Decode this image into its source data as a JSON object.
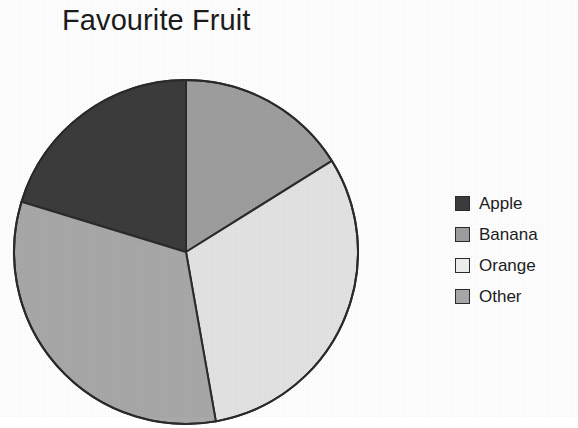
{
  "chart_data": {
    "type": "pie",
    "title": "Favourite Fruit",
    "subtitle": "",
    "xlabel": "",
    "ylabel": "",
    "grid": false,
    "legend_position": "right",
    "categories": [
      "Apple",
      "Banana",
      "Orange",
      "Other"
    ],
    "values": [
      20.5,
      16.0,
      31.0,
      32.5
    ],
    "units": "percent",
    "start_angle_deg": 0,
    "direction": "clockwise",
    "slices": [
      {
        "label": "Apple",
        "value": 20.5,
        "color": "#3c3c3c",
        "start_angle_deg": 287,
        "end_angle_deg": 360
      },
      {
        "label": "Banana",
        "value": 16.0,
        "color": "#9e9e9e",
        "start_angle_deg": 0,
        "end_angle_deg": 58
      },
      {
        "label": "Orange",
        "value": 31.0,
        "color": "#e3e3e3",
        "start_angle_deg": 58,
        "end_angle_deg": 170
      },
      {
        "label": "Other",
        "value": 32.5,
        "color": "#a8a8a8",
        "start_angle_deg": 170,
        "end_angle_deg": 287
      }
    ],
    "geometry": {
      "center_x": 176,
      "center_y": 176,
      "radius": 172,
      "outline_color": "#2b2b2b"
    }
  },
  "legend": {
    "items": [
      {
        "label": "Apple",
        "color": "#3c3c3c"
      },
      {
        "label": "Banana",
        "color": "#9e9e9e"
      },
      {
        "label": "Orange",
        "color": "#efefef"
      },
      {
        "label": "Other",
        "color": "#a8a8a8"
      }
    ]
  },
  "colors": {
    "background": "#ffffff",
    "text": "#1c1c1c",
    "outline": "#2b2b2b",
    "apple": "#3c3c3c",
    "banana": "#9e9e9e",
    "orange": "#e3e3e3",
    "other": "#a8a8a8"
  }
}
